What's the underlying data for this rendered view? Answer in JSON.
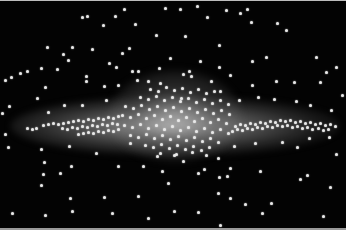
{
  "scene": {
    "subject": "edge-on galaxy with stars",
    "background_color": "#030303",
    "star_color": "#e8e8e8",
    "glow_color": "#bebebe"
  },
  "stars_outer": [
    [
      124,
      8
    ],
    [
      165,
      7
    ],
    [
      180,
      8
    ],
    [
      197,
      5
    ],
    [
      247,
      8
    ],
    [
      240,
      12
    ],
    [
      82,
      16
    ],
    [
      87,
      15
    ],
    [
      115,
      15
    ],
    [
      135,
      23
    ],
    [
      207,
      16
    ],
    [
      226,
      9
    ],
    [
      251,
      21
    ],
    [
      277,
      22
    ],
    [
      286,
      29
    ],
    [
      103,
      24
    ],
    [
      156,
      34
    ],
    [
      185,
      35
    ],
    [
      219,
      44
    ],
    [
      47,
      46
    ],
    [
      72,
      46
    ],
    [
      63,
      53
    ],
    [
      68,
      59
    ],
    [
      92,
      48
    ],
    [
      129,
      47
    ],
    [
      122,
      52
    ],
    [
      170,
      57
    ],
    [
      200,
      60
    ],
    [
      252,
      60
    ],
    [
      266,
      56
    ],
    [
      316,
      56
    ],
    [
      109,
      62
    ],
    [
      116,
      66
    ],
    [
      138,
      70
    ],
    [
      159,
      67
    ],
    [
      219,
      66
    ],
    [
      5,
      79
    ],
    [
      11,
      76
    ],
    [
      20,
      72
    ],
    [
      27,
      70
    ],
    [
      41,
      67
    ],
    [
      57,
      68
    ],
    [
      86,
      75
    ],
    [
      132,
      70
    ],
    [
      137,
      79
    ],
    [
      183,
      73
    ],
    [
      189,
      70
    ],
    [
      230,
      74
    ],
    [
      326,
      71
    ],
    [
      336,
      66
    ],
    [
      45,
      86
    ],
    [
      86,
      80
    ],
    [
      104,
      85
    ],
    [
      118,
      84
    ],
    [
      148,
      80
    ],
    [
      160,
      82
    ],
    [
      191,
      75
    ],
    [
      211,
      80
    ],
    [
      252,
      84
    ],
    [
      276,
      80
    ],
    [
      294,
      81
    ],
    [
      320,
      81
    ],
    [
      37,
      97
    ],
    [
      106,
      99
    ],
    [
      181,
      97
    ],
    [
      220,
      90
    ],
    [
      239,
      99
    ],
    [
      258,
      96
    ],
    [
      274,
      98
    ],
    [
      296,
      100
    ],
    [
      342,
      94
    ],
    [
      2,
      112
    ],
    [
      9,
      105
    ],
    [
      48,
      111
    ],
    [
      64,
      104
    ],
    [
      82,
      104
    ],
    [
      310,
      104
    ],
    [
      331,
      109
    ],
    [
      5,
      133
    ],
    [
      8,
      146
    ],
    [
      41,
      148
    ],
    [
      69,
      145
    ],
    [
      96,
      152
    ],
    [
      130,
      142
    ],
    [
      157,
      155
    ],
    [
      174,
      154
    ],
    [
      183,
      160
    ],
    [
      218,
      157
    ],
    [
      234,
      145
    ],
    [
      255,
      142
    ],
    [
      282,
      141
    ],
    [
      297,
      146
    ],
    [
      309,
      137
    ],
    [
      329,
      136
    ],
    [
      336,
      153
    ],
    [
      44,
      161
    ],
    [
      71,
      165
    ],
    [
      118,
      165
    ],
    [
      143,
      165
    ],
    [
      162,
      170
    ],
    [
      198,
      172
    ],
    [
      204,
      168
    ],
    [
      227,
      175
    ],
    [
      43,
      173
    ],
    [
      60,
      172
    ],
    [
      219,
      176
    ],
    [
      230,
      167
    ],
    [
      260,
      170
    ],
    [
      300,
      178
    ],
    [
      307,
      174
    ],
    [
      41,
      184
    ],
    [
      168,
      182
    ],
    [
      330,
      186
    ],
    [
      70,
      197
    ],
    [
      104,
      196
    ],
    [
      138,
      195
    ],
    [
      218,
      192
    ],
    [
      230,
      197
    ],
    [
      72,
      210
    ],
    [
      12,
      212
    ],
    [
      45,
      214
    ],
    [
      112,
      212
    ],
    [
      174,
      210
    ],
    [
      198,
      211
    ],
    [
      245,
      203
    ],
    [
      262,
      212
    ],
    [
      271,
      202
    ],
    [
      323,
      215
    ],
    [
      148,
      217
    ],
    [
      220,
      224
    ]
  ],
  "stars_disk": [
    [
      27,
      127
    ],
    [
      32,
      128
    ],
    [
      43,
      124
    ],
    [
      48,
      123
    ],
    [
      53,
      122
    ],
    [
      58,
      123
    ],
    [
      63,
      122
    ],
    [
      68,
      121
    ],
    [
      73,
      120
    ],
    [
      78,
      119
    ],
    [
      83,
      120
    ],
    [
      88,
      118
    ],
    [
      93,
      119
    ],
    [
      98,
      117
    ],
    [
      103,
      118
    ],
    [
      108,
      116
    ],
    [
      113,
      117
    ],
    [
      118,
      115
    ],
    [
      36,
      127
    ],
    [
      62,
      127
    ],
    [
      67,
      128
    ],
    [
      72,
      126
    ],
    [
      77,
      127
    ],
    [
      82,
      125
    ],
    [
      87,
      126
    ],
    [
      92,
      124
    ],
    [
      97,
      125
    ],
    [
      102,
      123
    ],
    [
      107,
      124
    ],
    [
      112,
      122
    ],
    [
      117,
      123
    ],
    [
      78,
      133
    ],
    [
      83,
      132
    ],
    [
      88,
      131
    ],
    [
      93,
      132
    ],
    [
      98,
      130
    ],
    [
      103,
      131
    ],
    [
      108,
      129
    ],
    [
      113,
      130
    ],
    [
      118,
      128
    ],
    [
      235,
      125
    ],
    [
      240,
      123
    ],
    [
      245,
      124
    ],
    [
      250,
      122
    ],
    [
      255,
      123
    ],
    [
      260,
      121
    ],
    [
      265,
      122
    ],
    [
      270,
      120
    ],
    [
      275,
      121
    ],
    [
      280,
      119
    ],
    [
      285,
      120
    ],
    [
      290,
      119
    ],
    [
      295,
      121
    ],
    [
      300,
      120
    ],
    [
      305,
      122
    ],
    [
      310,
      121
    ],
    [
      315,
      123
    ],
    [
      320,
      122
    ],
    [
      325,
      124
    ],
    [
      330,
      123
    ],
    [
      335,
      125
    ],
    [
      232,
      130
    ],
    [
      237,
      128
    ],
    [
      242,
      129
    ],
    [
      247,
      127
    ],
    [
      252,
      128
    ],
    [
      257,
      126
    ],
    [
      262,
      127
    ],
    [
      267,
      125
    ],
    [
      272,
      126
    ],
    [
      277,
      124
    ],
    [
      282,
      125
    ],
    [
      287,
      124
    ],
    [
      292,
      126
    ],
    [
      297,
      125
    ],
    [
      302,
      127
    ],
    [
      307,
      126
    ],
    [
      312,
      128
    ],
    [
      318,
      127
    ],
    [
      323,
      129
    ],
    [
      328,
      128
    ]
  ],
  "stars_bulge": [
    [
      150,
      88
    ],
    [
      158,
      90
    ],
    [
      166,
      86
    ],
    [
      174,
      89
    ],
    [
      182,
      87
    ],
    [
      190,
      91
    ],
    [
      198,
      88
    ],
    [
      206,
      92
    ],
    [
      214,
      90
    ],
    [
      140,
      96
    ],
    [
      148,
      98
    ],
    [
      156,
      95
    ],
    [
      164,
      99
    ],
    [
      172,
      96
    ],
    [
      180,
      100
    ],
    [
      188,
      97
    ],
    [
      196,
      101
    ],
    [
      204,
      98
    ],
    [
      212,
      102
    ],
    [
      220,
      99
    ],
    [
      228,
      103
    ],
    [
      125,
      105
    ],
    [
      133,
      107
    ],
    [
      141,
      104
    ],
    [
      149,
      108
    ],
    [
      157,
      105
    ],
    [
      165,
      109
    ],
    [
      173,
      106
    ],
    [
      181,
      110
    ],
    [
      189,
      107
    ],
    [
      197,
      111
    ],
    [
      205,
      108
    ],
    [
      213,
      112
    ],
    [
      221,
      109
    ],
    [
      229,
      113
    ],
    [
      122,
      114
    ],
    [
      130,
      116
    ],
    [
      138,
      113
    ],
    [
      146,
      117
    ],
    [
      154,
      114
    ],
    [
      162,
      118
    ],
    [
      170,
      115
    ],
    [
      178,
      119
    ],
    [
      186,
      116
    ],
    [
      194,
      120
    ],
    [
      202,
      117
    ],
    [
      210,
      121
    ],
    [
      218,
      118
    ],
    [
      226,
      122
    ],
    [
      124,
      124
    ],
    [
      132,
      126
    ],
    [
      140,
      123
    ],
    [
      148,
      127
    ],
    [
      156,
      124
    ],
    [
      164,
      128
    ],
    [
      172,
      125
    ],
    [
      180,
      129
    ],
    [
      188,
      126
    ],
    [
      196,
      130
    ],
    [
      204,
      127
    ],
    [
      212,
      131
    ],
    [
      220,
      128
    ],
    [
      228,
      132
    ],
    [
      130,
      134
    ],
    [
      138,
      136
    ],
    [
      146,
      133
    ],
    [
      154,
      137
    ],
    [
      162,
      134
    ],
    [
      170,
      138
    ],
    [
      178,
      135
    ],
    [
      186,
      139
    ],
    [
      194,
      136
    ],
    [
      202,
      140
    ],
    [
      210,
      137
    ],
    [
      218,
      141
    ],
    [
      145,
      144
    ],
    [
      153,
      146
    ],
    [
      161,
      143
    ],
    [
      169,
      147
    ],
    [
      177,
      144
    ],
    [
      185,
      148
    ],
    [
      193,
      145
    ],
    [
      201,
      149
    ],
    [
      209,
      146
    ],
    [
      160,
      152
    ],
    [
      176,
      153
    ],
    [
      192,
      151
    ],
    [
      206,
      154
    ]
  ]
}
